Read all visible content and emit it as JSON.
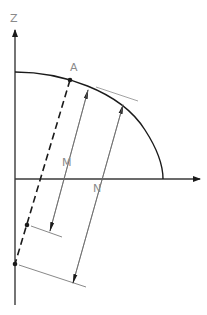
{
  "diagram": {
    "type": "geometry-ellipse-normal-section",
    "labels": {
      "z_axis": "Z",
      "point_a": "A",
      "dim_m": "M",
      "dim_n": "N"
    },
    "colors": {
      "background": "#ffffff",
      "stroke": "#1a1a1a",
      "thin_stroke": "#6a6a6a",
      "label": "#8a8a8a"
    }
  }
}
